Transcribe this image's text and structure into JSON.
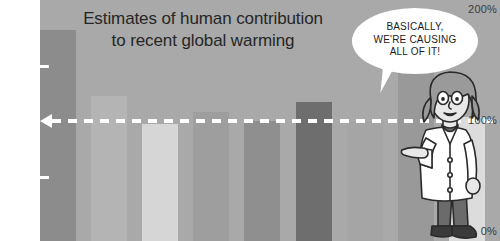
{
  "chart_data": {
    "type": "bar",
    "title": "Estimates of human contribution to recent global warming",
    "title_line1": "Estimates of human contribution",
    "title_line2": "to recent global warming",
    "xlabel": "",
    "ylabel": "",
    "ylim": [
      0,
      200
    ],
    "grid": false,
    "legend": "none",
    "ytick_labels": [
      "200%",
      "100%",
      "0%"
    ],
    "ytick_values": [
      200,
      100,
      0
    ],
    "minor_ticks": [
      150,
      50
    ],
    "categories": [
      "1",
      "2",
      "3",
      "4",
      "5",
      "6",
      "7",
      "8",
      "9"
    ],
    "values": [
      175,
      120,
      97,
      107,
      100,
      115,
      100,
      145,
      103
    ],
    "bar_colors": [
      "#8c8c8c",
      "#b4b4b4",
      "#d6d6d6",
      "#9e9e9e",
      "#8f8f8f",
      "#6e6e6e",
      "#a5a5a5",
      "#999999",
      "#dcdcdc"
    ],
    "annotations": [
      {
        "name": "reference-line",
        "value": 100,
        "label": "100%",
        "style": "white dashed line with left arrowhead"
      }
    ],
    "background_color": "#a9a9a9",
    "axis_panel_color": "#ffffff"
  },
  "speech_bubble": {
    "line1": "BASICALLY,",
    "line2": "WE'RE CAUSING",
    "line3": "ALL OF IT!"
  },
  "character": {
    "name": "scientist",
    "description": "scientist in white lab coat pointing left",
    "coat_color": "#ffffff",
    "hair_color": "#9a9a9a",
    "skin_color": "#e8e8e8",
    "pants_color": "#6b6b6b",
    "shoe_color": "#3a3a3a"
  }
}
